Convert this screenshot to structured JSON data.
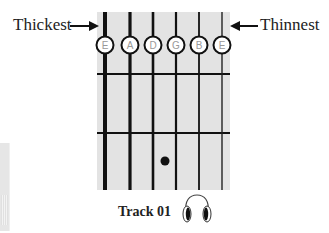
{
  "diagram": {
    "left_label": "Thickest",
    "right_label": "Thinnest",
    "strings": [
      {
        "note": "E",
        "x": 105,
        "width": 4
      },
      {
        "note": "A",
        "x": 130,
        "width": 3.2
      },
      {
        "note": "D",
        "x": 153,
        "width": 2.6
      },
      {
        "note": "G",
        "x": 176,
        "width": 2.2
      },
      {
        "note": "B",
        "x": 199,
        "width": 1.8
      },
      {
        "note": "E",
        "x": 222,
        "width": 1.4
      }
    ],
    "frets_y": [
      74,
      133
    ],
    "fret_dot": {
      "string": "D",
      "fret": 2,
      "x": 165,
      "y": 161
    },
    "track_label": "Track 01",
    "track_icon": "headphones-icon",
    "colors": {
      "fretboard": "#e3e3e3",
      "lines": "#111111",
      "note_text": "#999999",
      "circle_fill": "#ffffff"
    }
  }
}
